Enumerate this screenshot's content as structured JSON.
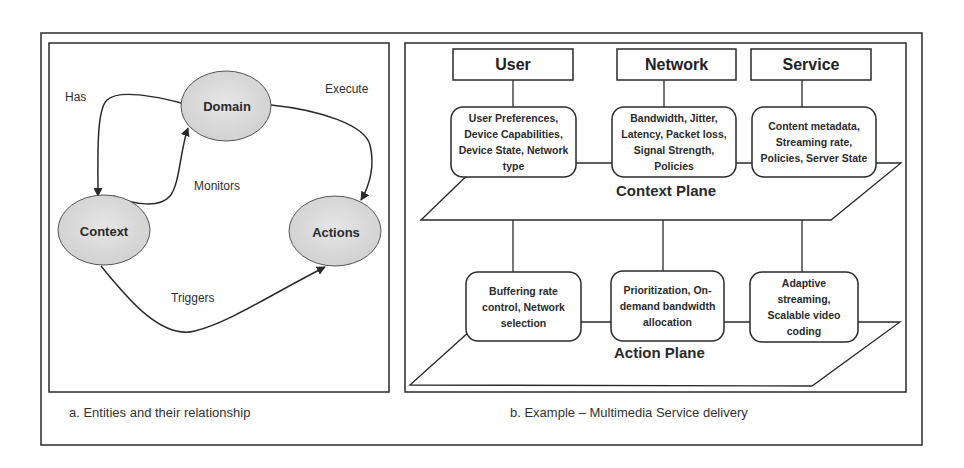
{
  "panel_a": {
    "nodes": {
      "domain": "Domain",
      "context": "Context",
      "actions": "Actions"
    },
    "edges": {
      "has": "Has",
      "execute": "Execute",
      "monitors": "Monitors",
      "triggers": "Triggers"
    },
    "caption": "a. Entities and their relationship"
  },
  "panel_b": {
    "headers": {
      "user": "User",
      "network": "Network",
      "service": "Service"
    },
    "context_plane": {
      "label": "Context Plane",
      "boxes": {
        "user": [
          "User Preferences,",
          "Device Capabilities,",
          "Device State, Network",
          "type"
        ],
        "network": [
          "Bandwidth, Jitter,",
          "Latency, Packet loss,",
          "Signal Strength,",
          "Policies"
        ],
        "service": [
          "Content metadata,",
          "Streaming rate,",
          "Policies, Server State"
        ]
      }
    },
    "action_plane": {
      "label": "Action Plane",
      "boxes": {
        "user": [
          "Buffering rate",
          "control, Network",
          "selection"
        ],
        "network": [
          "Prioritization, On-",
          "demand bandwidth",
          "allocation"
        ],
        "service": [
          "Adaptive",
          "streaming,",
          "Scalable video",
          "coding"
        ]
      }
    },
    "caption": "b. Example – Multimedia Service delivery"
  },
  "colors": {
    "stroke": "#2a2a2a",
    "ellipse_fill": "#dcdcdc",
    "background": "#ffffff"
  }
}
